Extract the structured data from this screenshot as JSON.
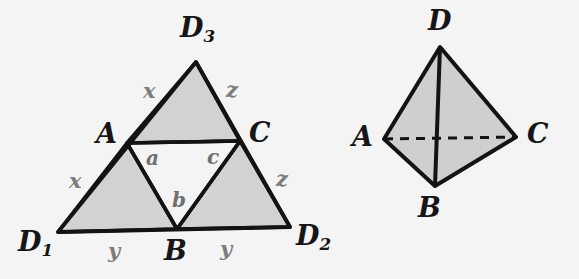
{
  "figure": {
    "caption_none": "",
    "background_color": "#f4f4f4",
    "fill_color": "#d2d2d2",
    "stroke_color": "#131313",
    "label_gray": "#7b7b7b"
  },
  "left_diagram": {
    "name": "subdivided-triangle",
    "vertices": {
      "d1": "D",
      "d1_sub": "1",
      "d2": "D",
      "d2_sub": "2",
      "d3": "D",
      "d3_sub": "3",
      "a": "A",
      "b": "B",
      "c": "C"
    },
    "edge_labels": {
      "upper_left_x": "x",
      "upper_right_z": "z",
      "lower_left_x": "x",
      "lower_right_z": "z",
      "bottom_left_y": "y",
      "bottom_right_y": "y"
    },
    "inner_labels": {
      "a": "a",
      "b": "b",
      "c": "c"
    }
  },
  "right_diagram": {
    "name": "tetrahedron",
    "vertices": {
      "a": "A",
      "b": "B",
      "c": "C",
      "d": "D"
    },
    "hidden_edge": "A-C dashed"
  }
}
